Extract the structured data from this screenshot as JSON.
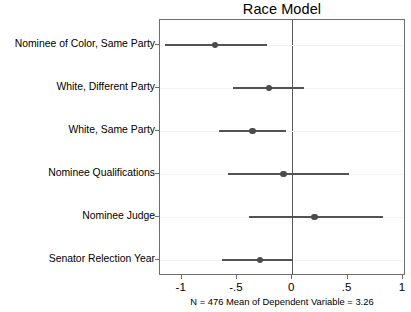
{
  "chart_data": {
    "type": "scatter",
    "title": "Race Model",
    "subtitle": "",
    "xlabel": "",
    "ylabel": "",
    "xlim": [
      -1.27,
      1.0
    ],
    "xticks": [
      -1,
      -0.5,
      0,
      0.5,
      1
    ],
    "xtick_labels": [
      "-1",
      "-.5",
      "0",
      ".5",
      "1"
    ],
    "grid": true,
    "legend": "none",
    "reference_line": 0,
    "orientation": "horizontal",
    "note": "N = 476 Mean of Dependent Variable = 3.26",
    "categories": [
      "Nominee of Color, Same Party",
      "White, Different Party",
      "White, Same Party",
      "Nominee Qualifications",
      "Nominee Judge",
      "Senator Relection Year"
    ],
    "points": [
      {
        "label": "Nominee of Color, Same Party",
        "estimate": -0.7,
        "ci_low": -1.15,
        "ci_high": -0.23
      },
      {
        "label": "White, Different Party",
        "estimate": -0.21,
        "ci_low": -0.54,
        "ci_high": 0.11
      },
      {
        "label": "White, Same Party",
        "estimate": -0.36,
        "ci_low": -0.66,
        "ci_high": -0.06
      },
      {
        "label": "Nominee Qualifications",
        "estimate": -0.08,
        "ci_low": -0.58,
        "ci_high": 0.51
      },
      {
        "label": "Nominee Judge",
        "estimate": 0.2,
        "ci_low": -0.39,
        "ci_high": 0.82
      },
      {
        "label": "Senator Relection Year",
        "estimate": -0.29,
        "ci_low": -0.64,
        "ci_high": 0.01
      }
    ]
  },
  "footer": {
    "note": "N = 476 Mean of Dependent Variable = 3.26"
  },
  "axis": {
    "tick_labels": [
      "-1",
      "-.5",
      "0",
      ".5",
      "1"
    ]
  },
  "colors": {
    "point": "#4b4b4b",
    "ci": "#535353",
    "frame": "#6e6e6e",
    "zero_line": "#5a5a5a",
    "grid": "#f2f2f2",
    "background": "#ffffff"
  }
}
